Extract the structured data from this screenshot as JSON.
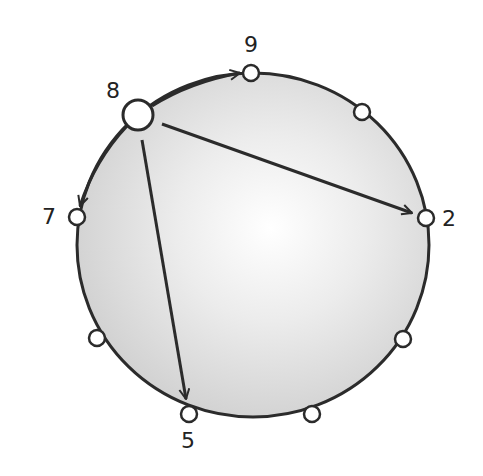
{
  "diagram": {
    "type": "cycle-with-jumps",
    "colors": {
      "stroke": "#2b2b2b",
      "fill_shade": "#d9d9d9",
      "background": "#ffffff"
    },
    "nodes": [
      {
        "id": "n8",
        "label": "8",
        "x": 138,
        "y": 115,
        "r": 15
      },
      {
        "id": "n9",
        "label": "9",
        "x": 251,
        "y": 73,
        "r": 8
      },
      {
        "id": "n_tr",
        "label": "",
        "x": 362,
        "y": 112,
        "r": 8
      },
      {
        "id": "n2",
        "label": "2",
        "x": 426,
        "y": 218,
        "r": 8
      },
      {
        "id": "n_lr",
        "label": "",
        "x": 403,
        "y": 339,
        "r": 8
      },
      {
        "id": "n_br",
        "label": "",
        "x": 312,
        "y": 414,
        "r": 8
      },
      {
        "id": "n5",
        "label": "5",
        "x": 189,
        "y": 414,
        "r": 8
      },
      {
        "id": "n_ll",
        "label": "",
        "x": 97,
        "y": 338,
        "r": 8
      },
      {
        "id": "n7",
        "label": "7",
        "x": 77,
        "y": 217,
        "r": 8
      }
    ],
    "labels": {
      "n8": "8",
      "n9": "9",
      "n2": "2",
      "n5": "5",
      "n7": "7"
    },
    "edges": [
      {
        "from": "8",
        "to": "9",
        "kind": "arc-arrow"
      },
      {
        "from": "8",
        "to": "7",
        "kind": "arc-arrow"
      },
      {
        "from": "8",
        "to": "2",
        "kind": "straight-arrow"
      },
      {
        "from": "8",
        "to": "5",
        "kind": "straight-arrow"
      }
    ]
  }
}
